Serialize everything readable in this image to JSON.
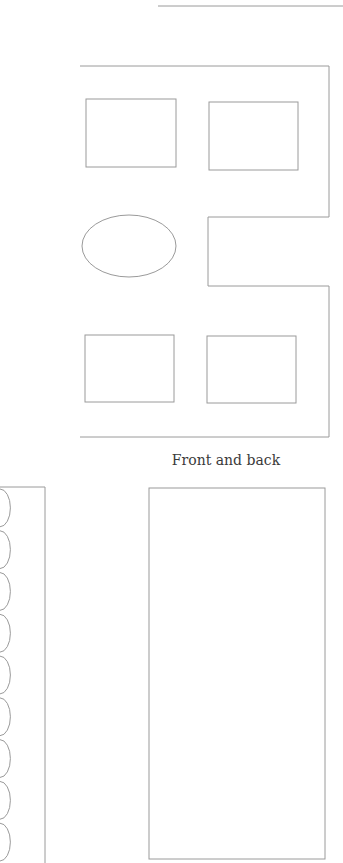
{
  "caption": "Front and back",
  "colors": {
    "line": "#9a9a9a",
    "text": "#3a3a3a",
    "background": "#ffffff"
  },
  "figure": {
    "top_rule": {
      "x1": 158,
      "y": 6,
      "x2": 343
    },
    "outer_frame_points": "80,66 329,66 329,217 208,217 208,286 329,286 329,437 80,437",
    "top_left_rect": {
      "x": 86,
      "y": 99,
      "w": 90,
      "h": 68
    },
    "top_right_rect": {
      "x": 209,
      "y": 102,
      "w": 89,
      "h": 68
    },
    "ellipse": {
      "cx": 129,
      "cy": 246,
      "rx": 47,
      "ry": 31
    },
    "bottom_left_rect": {
      "x": 85,
      "y": 335,
      "w": 89,
      "h": 67
    },
    "bottom_right_rect": {
      "x": 207,
      "y": 336,
      "w": 89,
      "h": 67
    },
    "scalloped_strip": {
      "right_x": 45,
      "top_y": 487,
      "bottom_y": 863,
      "scallop_count": 9
    },
    "tall_rect": {
      "x": 149,
      "y": 488,
      "w": 176,
      "h": 371
    }
  }
}
